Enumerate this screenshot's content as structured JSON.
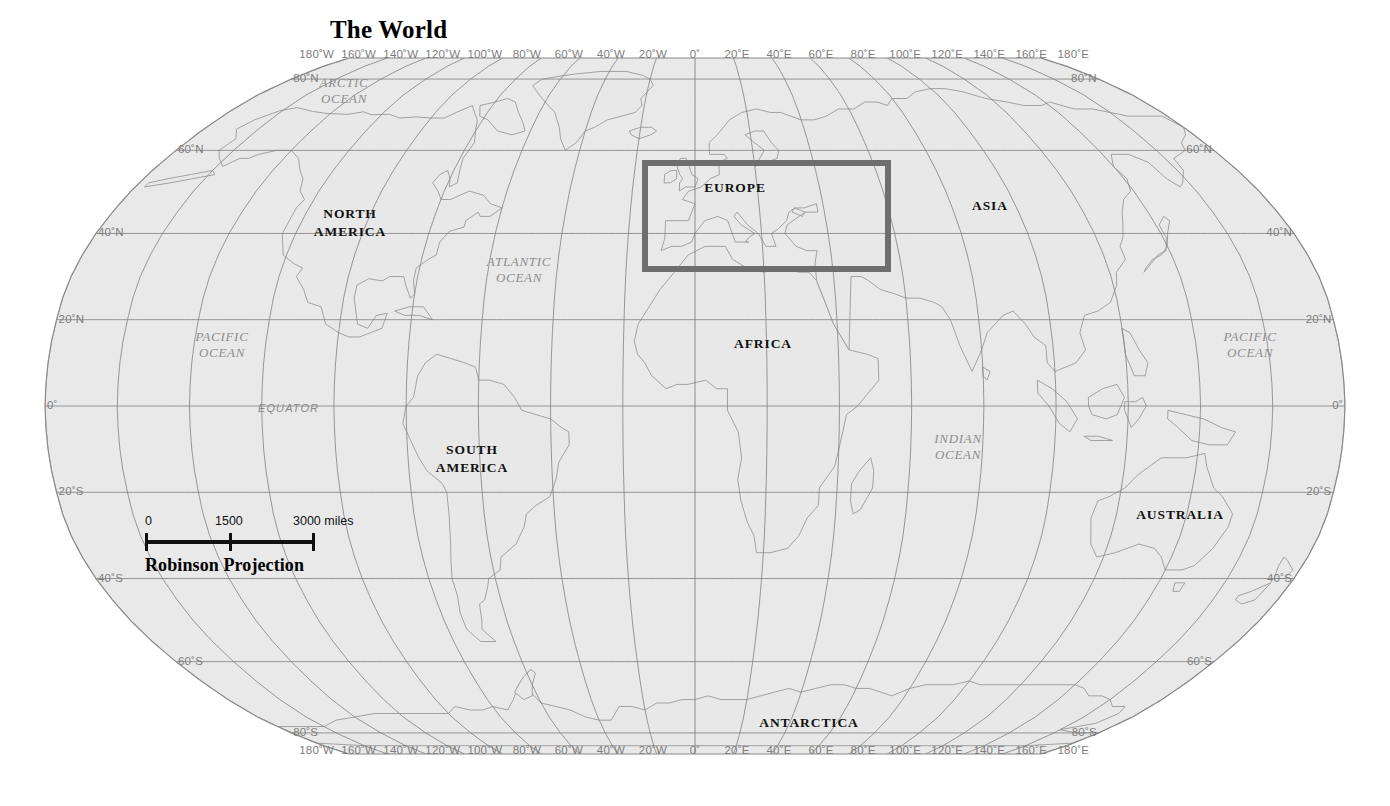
{
  "title": "The World",
  "projection_caption": "Robinson Projection",
  "map": {
    "land_fill": "#e8e8e8",
    "land_stroke": "#9a9a9a",
    "graticule_color": "#7f7f7f",
    "outline_color": "#8a8a8a",
    "background": "#ffffff",
    "highlight_color": "#6e6e6e"
  },
  "scale_bar": {
    "ticks": [
      "0",
      "1500",
      "3000 miles"
    ],
    "unit": "miles",
    "values": [
      0,
      1500,
      3000
    ]
  },
  "graticule": {
    "longitude_labels_top": [
      "180˚W",
      "160˚W",
      "140˚W",
      "120˚W",
      "100˚W",
      "80˚W",
      "60˚W",
      "40˚W",
      "20˚W",
      "0˚",
      "20˚E",
      "40˚E",
      "60˚E",
      "80˚E",
      "100˚E",
      "120˚E",
      "140˚E",
      "160˚E",
      "180˚E"
    ],
    "longitude_labels_bottom": [
      "180˚W",
      "160˚W",
      "140˚W",
      "120˚W",
      "100˚W",
      "80˚W",
      "60˚W",
      "40˚W",
      "20˚W",
      "0˚",
      "20˚E",
      "40˚E",
      "60˚E",
      "80˚E",
      "100˚E",
      "120˚E",
      "140˚E",
      "160˚E",
      "180˚E"
    ],
    "longitude_values": [
      -180,
      -160,
      -140,
      -120,
      -100,
      -80,
      -60,
      -40,
      -20,
      0,
      20,
      40,
      60,
      80,
      100,
      120,
      140,
      160,
      180
    ],
    "latitude_labels_left": [
      "80˚N",
      "60˚N",
      "40˚N",
      "20˚N",
      "0˚",
      "20˚S",
      "40˚S",
      "60˚S",
      "80˚S"
    ],
    "latitude_labels_right": [
      "80˚N",
      "60˚N",
      "40˚N",
      "20˚N",
      "0˚",
      "20˚S",
      "40˚S",
      "60˚S",
      "80˚S"
    ],
    "latitude_values": [
      80,
      60,
      40,
      20,
      0,
      -20,
      -40,
      -60,
      -80
    ],
    "equator_label": "EQUATOR"
  },
  "continents": [
    {
      "name": "north-america",
      "label_line1": "NORTH",
      "label_line2": "AMERICA",
      "x": 350,
      "y": 214
    },
    {
      "name": "south-america",
      "label_line1": "SOUTH",
      "label_line2": "AMERICA",
      "x": 472,
      "y": 450
    },
    {
      "name": "europe",
      "label_line1": "EUROPE",
      "label_line2": "",
      "x": 735,
      "y": 188
    },
    {
      "name": "africa",
      "label_line1": "AFRICA",
      "label_line2": "",
      "x": 763,
      "y": 344
    },
    {
      "name": "asia",
      "label_line1": "ASIA",
      "label_line2": "",
      "x": 990,
      "y": 206
    },
    {
      "name": "australia",
      "label_line1": "AUSTRALIA",
      "label_line2": "",
      "x": 1180,
      "y": 515
    },
    {
      "name": "antarctica",
      "label_line1": "ANTARCTICA",
      "label_line2": "",
      "x": 809,
      "y": 723
    }
  ],
  "oceans": [
    {
      "name": "arctic-ocean",
      "label_line1": "ARCTIC",
      "label_line2": "OCEAN",
      "x": 344,
      "y": 84
    },
    {
      "name": "atlantic-ocean",
      "label_line1": "ATLANTIC",
      "label_line2": "OCEAN",
      "x": 519,
      "y": 263
    },
    {
      "name": "pacific-ocean-e",
      "label_line1": "PACIFIC",
      "label_line2": "OCEAN",
      "x": 222,
      "y": 338
    },
    {
      "name": "pacific-ocean-w",
      "label_line1": "PACIFIC",
      "label_line2": "OCEAN",
      "x": 1250,
      "y": 338
    },
    {
      "name": "indian-ocean",
      "label_line1": "INDIAN",
      "label_line2": "OCEAN",
      "x": 958,
      "y": 440
    }
  ],
  "highlight": {
    "region": "Europe",
    "left": 642,
    "top": 160,
    "width": 249,
    "height": 112
  }
}
